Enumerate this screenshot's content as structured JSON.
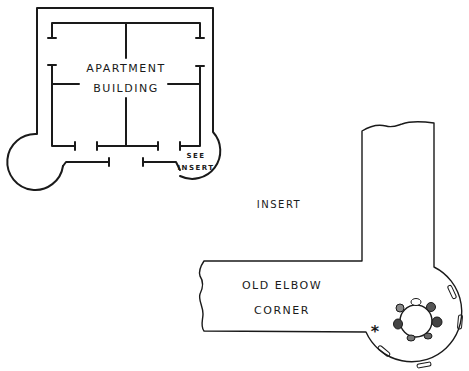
{
  "diagram": {
    "type": "floor-plan",
    "apartment": {
      "label_line1": "APARTMENT",
      "label_line2": "BUILDING",
      "callout_line1": "SEE",
      "callout_line2": "INSERT"
    },
    "insert": {
      "title": "INSERT",
      "corner_label_line1": "OLD ELBOW",
      "corner_label_line2": "CORNER",
      "marker": "*"
    },
    "colors": {
      "ink": "#1a1a1a",
      "background": "#ffffff"
    }
  }
}
